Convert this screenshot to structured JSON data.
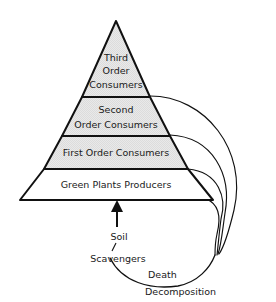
{
  "diagram": {
    "type": "trophic-pyramid",
    "background_color": "#ffffff",
    "outline_color": "#111111",
    "shaded_fill": "#e8e8e8",
    "unshaded_fill": "#ffffff"
  },
  "pyramid": {
    "tiers": [
      {
        "id": "third-order-consumers",
        "level": 4,
        "position": "top",
        "shaded": true,
        "lines": [
          "Third",
          "Order",
          "Consumers"
        ]
      },
      {
        "id": "second-order-consumers",
        "level": 3,
        "position": "upper-middle",
        "shaded": true,
        "lines": [
          "Second",
          "Order Consumers"
        ]
      },
      {
        "id": "first-order-consumers",
        "level": 2,
        "position": "lower-middle",
        "shaded": true,
        "lines": [
          "First Order Consumers"
        ]
      },
      {
        "id": "green-plants-producers",
        "level": 1,
        "position": "base",
        "shaded": false,
        "lines": [
          "Green Plants Producers"
        ]
      }
    ]
  },
  "flow": {
    "soil_label": "Soil",
    "scavengers_label": "Scavengers",
    "death_label": "Death",
    "decomposition_label": "Decomposition"
  }
}
